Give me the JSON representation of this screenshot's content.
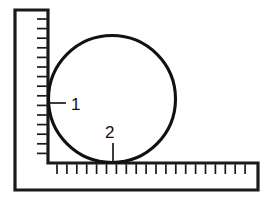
{
  "figure": {
    "background_color": "#ffffff",
    "ink_color": "#1a1a1a",
    "width": 267,
    "height": 199
  },
  "ruler": {
    "name": "L-shaped carpenter's square",
    "outline_color": "#1a1a1a",
    "fill_color": "#ffffff",
    "stroke_width": 3.2,
    "vertical_arm": {
      "outer_left_x": 15,
      "inner_right_x": 48,
      "top_y": 10,
      "bottom_y": 190,
      "tick_edge": "right",
      "tick_count": 17,
      "tick_start_y": 19,
      "tick_spacing": 9.6,
      "tick_length": 11,
      "tick_width": 1.7
    },
    "horizontal_arm": {
      "outer_right_x": 258,
      "top_y": 163,
      "bottom_y": 190,
      "left_x": 15,
      "tick_edge": "top",
      "tick_count": 20,
      "tick_start_x": 57,
      "tick_spacing": 9.9,
      "tick_length": 11,
      "tick_width": 1.7
    }
  },
  "circle": {
    "name": "circle",
    "center_x": 112,
    "center_y": 99,
    "radius": 63.5,
    "stroke_color": "#111111",
    "stroke_width": 3.1,
    "fill": "none"
  },
  "callouts": [
    {
      "label": "1",
      "name": "callout-1",
      "description": "tangent point on vertical ruler",
      "text_x": 71,
      "text_y": 110,
      "leader": {
        "x1": 49,
        "y1": 103,
        "x2": 66,
        "y2": 103
      },
      "leader_orientation": "horizontal"
    },
    {
      "label": "2",
      "name": "callout-2",
      "description": "tangent point on horizontal ruler",
      "text_x": 105,
      "text_y": 138,
      "leader": {
        "x1": 113,
        "y1": 143,
        "x2": 113,
        "y2": 163
      },
      "leader_orientation": "vertical"
    }
  ]
}
